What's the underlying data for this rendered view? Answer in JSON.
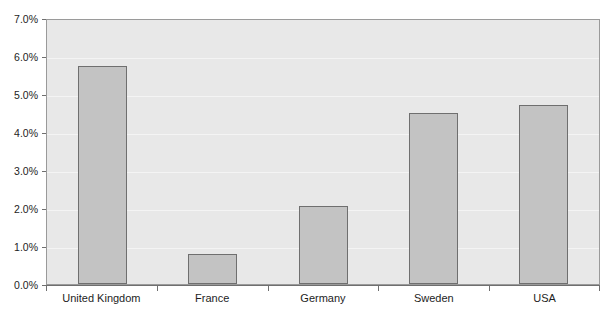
{
  "chart_data": {
    "type": "bar",
    "title": "",
    "xlabel": "",
    "ylabel": "",
    "categories": [
      "United Kingdom",
      "France",
      "Germany",
      "Sweden",
      "USA"
    ],
    "values": [
      5.75,
      0.8,
      2.05,
      4.5,
      4.7
    ],
    "value_unit": "%",
    "ylim": [
      0,
      7
    ],
    "ytick_step": 1,
    "ytick_labels": [
      "0.0%",
      "1.0%",
      "2.0%",
      "3.0%",
      "4.0%",
      "5.0%",
      "6.0%",
      "7.0%"
    ],
    "ytick_values": [
      0,
      1,
      2,
      3,
      4,
      5,
      6,
      7
    ],
    "grid": true,
    "legend": false,
    "series": [
      {
        "name": "",
        "values": [
          5.75,
          0.8,
          2.05,
          4.5,
          4.7
        ]
      }
    ],
    "colors": {
      "bar_fill": "#c3c3c3",
      "bar_border": "#6f6f6f",
      "plot_background": "#e8e8e8",
      "gridline": "#f4f4f4",
      "axis": "#6f6f6f",
      "text": "#1d1d1d"
    }
  }
}
